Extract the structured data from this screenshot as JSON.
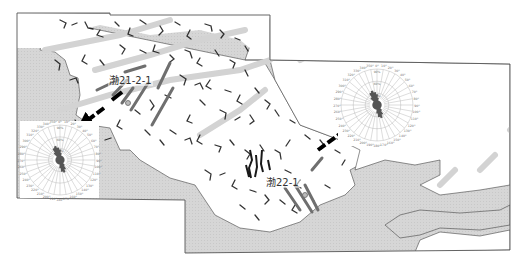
{
  "map": {
    "type": "geological stress orientation map",
    "colors": {
      "sea": "#d4d4d4",
      "land": "#ffffff",
      "drainage": "#111111",
      "fault": "#7a7a7a",
      "fault_faint": "#cfcfcf",
      "frame": "#555555",
      "arrow": "#000000",
      "rose_petal": "#555555",
      "rose_grid": "#9a9a9a"
    },
    "wells": [
      {
        "label": "渤21-2-1",
        "x": 108,
        "y": 75
      },
      {
        "label": "渤22-1",
        "x": 265,
        "y": 177
      }
    ],
    "rose_diagrams": [
      {
        "name": "west-rose",
        "cx": 60,
        "cy": 160,
        "r": 35,
        "ring_labels": [
          "90%",
          "60%",
          "30%"
        ],
        "angle_labels": [
          "0°",
          "10°",
          "20°",
          "30°",
          "40°",
          "50°",
          "60°",
          "70°",
          "80°",
          "90°",
          "100°",
          "110°",
          "120°",
          "130°",
          "140°",
          "150°",
          "160°",
          "170°",
          "180°",
          "190°",
          "200°",
          "210°",
          "220°",
          "230°",
          "240°",
          "250°",
          "260°",
          "270°",
          "280°",
          "290°",
          "300°",
          "310°",
          "320°",
          "330°",
          "340°",
          "350°"
        ],
        "dominant_direction": "NNW-SSE"
      },
      {
        "name": "east-rose",
        "cx": 377,
        "cy": 105,
        "r": 36,
        "ring_labels": [
          "90%",
          "60%",
          "30%"
        ],
        "angle_labels": [
          "0°",
          "10°",
          "20°",
          "30°",
          "40°",
          "50°",
          "60°",
          "70°",
          "80°",
          "90°",
          "100°",
          "110°",
          "120°",
          "130°",
          "140°",
          "150°",
          "160°",
          "170°",
          "180°",
          "190°",
          "200°",
          "210°",
          "220°",
          "230°",
          "240°",
          "250°",
          "260°",
          "270°",
          "280°",
          "290°",
          "300°",
          "310°",
          "320°",
          "330°",
          "340°",
          "350°"
        ],
        "dominant_direction": "NNW-SSE"
      }
    ],
    "arrows": [
      {
        "name": "stress-arrow-west",
        "from": [
          104,
          108
        ],
        "to": [
          78,
          128
        ]
      },
      {
        "name": "stress-arrow-east",
        "from": [
          325,
          145
        ],
        "to": [
          362,
          118
        ]
      }
    ]
  }
}
